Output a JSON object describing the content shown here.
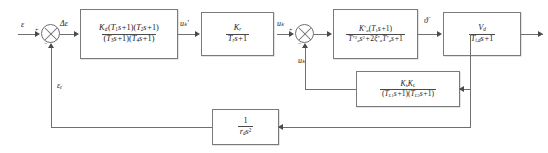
{
  "diagram": {
    "type": "control-block-diagram"
  },
  "signals": {
    "input": "ε",
    "error": "Δε",
    "compensator_out": "uₖ'",
    "actuator_out": "uₖ",
    "inner_feedback": "uₖ",
    "pitch_rate": "ϑ̇",
    "outer_feedback": "εₑ"
  },
  "summers": {
    "first": {
      "name": "outer-loop-summer",
      "plus": "+",
      "minus": "−"
    },
    "second": {
      "name": "inner-loop-summer",
      "plus": "+",
      "minus": "−"
    }
  },
  "blocks": [
    {
      "id": "compensator",
      "name": "lead-lag-compensator",
      "numerator": "Kₑ(T₁s+1)(T₂s+1)",
      "denominator": "(T₃s+1)(T₄s+1)",
      "num_parts": {
        "gain": "K",
        "gain_sub": "d",
        "z1": "T",
        "z1_sub": "1",
        "z2": "T",
        "z2_sub": "2"
      },
      "den_parts": {
        "p1": "T",
        "p1_sub": "3",
        "p2": "T",
        "p2_sub": "4"
      }
    },
    {
      "id": "actuator",
      "name": "actuator-lag",
      "numerator": "Kᵣ",
      "denominator": "Tᵣs+1",
      "num_parts": {
        "gain": "K",
        "gain_sub": "r"
      },
      "den_parts": {
        "p1": "T",
        "p1_sub": "r"
      }
    },
    {
      "id": "airframe",
      "name": "airframe-dynamics",
      "numerator": "K*ₐ(T₁s+1)",
      "denominator": "T*ₐ²s²+2ξ*ₐT*ₐs+1",
      "num_parts": {
        "gain": "K",
        "gain_sub": "a",
        "z1": "T",
        "z1_sub": "1"
      },
      "den_parts": {
        "t": "T",
        "t_sub": "a",
        "zeta": "ξ",
        "zeta_sub": "a"
      }
    },
    {
      "id": "kinematics",
      "name": "velocity-kinematics",
      "numerator": "Vₑ",
      "denominator": "Tᵢ,ₑs+1",
      "num_parts": {
        "gain": "V",
        "gain_sub": "d"
      },
      "den_parts": {
        "p1": "T",
        "p1_sub": "i,d"
      }
    },
    {
      "id": "rate-feedback",
      "name": "inner-rate-feedback",
      "numerator": "KₖKʟ",
      "denominator": "(Tʟ₁s+1)(Tʟ₂s+1)",
      "num_parts": {
        "g1": "K",
        "g1_sub": "k",
        "g2": "K",
        "g2_sub": "L"
      },
      "den_parts": {
        "p1": "T",
        "p1_sub": "L1",
        "p2": "T",
        "p2_sub": "L2"
      }
    },
    {
      "id": "position-feedback",
      "name": "outer-position-feedback",
      "numerator": "1",
      "denominator": "rₑs²",
      "den_parts": {
        "r": "r",
        "r_sub": "d",
        "s": "s",
        "s_sup": "2"
      }
    }
  ],
  "colors": {
    "line": "#6f6f6f",
    "arrow": "#4a4a4a",
    "text": "#1b1b1b",
    "background": "#ffffff"
  }
}
